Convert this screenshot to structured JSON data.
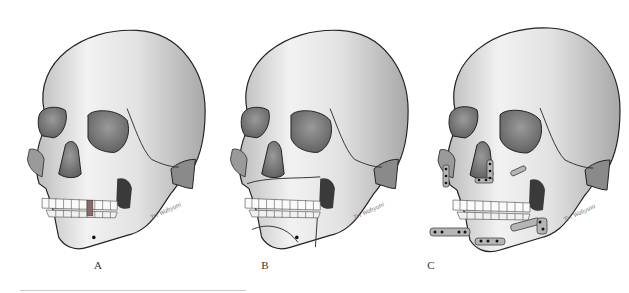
{
  "figure": {
    "panels": [
      {
        "id": "A",
        "label": "A",
        "description": "skull with missing/dark teeth and open jaw"
      },
      {
        "id": "B",
        "label": "B",
        "description": "skull with fracture lines on maxilla and mandible"
      },
      {
        "id": "C",
        "label": "C",
        "description": "skull with fixation plates and screws"
      }
    ],
    "signature": "Tri Wahyuni",
    "colors": {
      "bone": "#e6e6e6",
      "outline": "#222222",
      "shadow": "#8a8a8a",
      "plate": "#b0b0b0"
    }
  }
}
